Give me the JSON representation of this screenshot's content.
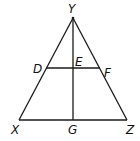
{
  "diagram": {
    "type": "triangle-with-midsegment-and-altitude",
    "points": {
      "Y": {
        "label": "Y",
        "x": 73,
        "y": 18
      },
      "X": {
        "label": "X",
        "x": 19,
        "y": 120
      },
      "Z": {
        "label": "Z",
        "x": 127,
        "y": 120
      },
      "G": {
        "label": "G",
        "x": 73,
        "y": 120
      },
      "D": {
        "label": "D",
        "x": 46,
        "y": 68
      },
      "F": {
        "label": "F",
        "x": 100,
        "y": 68
      },
      "E": {
        "label": "E",
        "x": 73,
        "y": 68
      }
    },
    "segments": [
      "XY",
      "YZ",
      "XZ",
      "YG",
      "DF"
    ]
  }
}
